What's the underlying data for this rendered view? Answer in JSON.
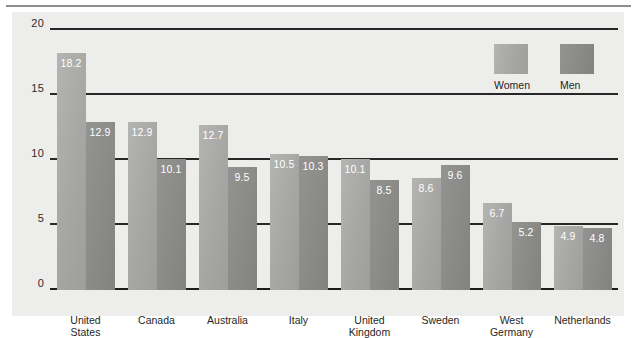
{
  "chart_data": {
    "type": "bar",
    "title": "",
    "xlabel": "",
    "ylabel": "",
    "ylim": [
      0,
      20
    ],
    "yticks": [
      "0",
      "5",
      "10",
      "15",
      "20"
    ],
    "grid": true,
    "legend_position": "top-right",
    "categories": [
      "United\nStates",
      "Canada",
      "Australia",
      "Italy",
      "United\nKingdom",
      "Sweden",
      "West\nGermany",
      "Netherlands"
    ],
    "series": [
      {
        "name": "Women",
        "color": "#a6a6a4",
        "values": [
          18.2,
          12.9,
          12.7,
          10.5,
          10.1,
          8.6,
          6.7,
          4.9
        ],
        "labels": [
          "18.2",
          "12.9",
          "12.7",
          "10.5",
          "10.1",
          "8.6",
          "6.7",
          "4.9"
        ]
      },
      {
        "name": "Men",
        "color": "#8a8a88",
        "values": [
          12.9,
          10.1,
          9.5,
          10.3,
          8.5,
          9.6,
          5.2,
          4.8
        ],
        "labels": [
          "12.9",
          "10.1",
          "9.5",
          "10.3",
          "8.5",
          "9.6",
          "5.2",
          "4.8"
        ]
      }
    ]
  },
  "legend": {
    "items": [
      {
        "label": "Women",
        "swatch": "women"
      },
      {
        "label": "Men",
        "swatch": "men"
      }
    ]
  }
}
